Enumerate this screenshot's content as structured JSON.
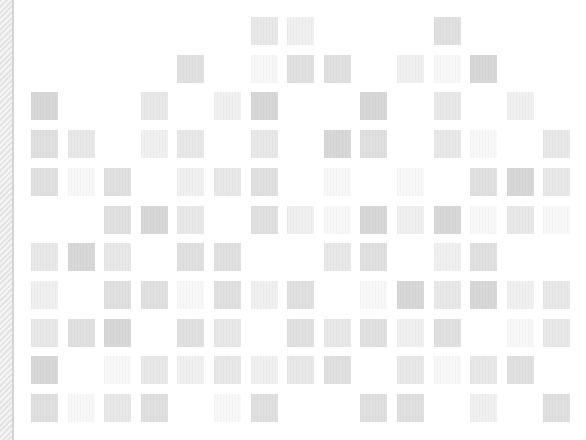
{
  "layout": {
    "cols": 15,
    "rows": 11,
    "x0": 31,
    "y0": 17,
    "dx": 36.6,
    "dy": 37.7
  },
  "shades": {
    "1": "#f8f8f8",
    "2": "#f0f0f0",
    "3": "#e8e8e8",
    "4": "#e0e0e0",
    "5": "#d8d8d8"
  },
  "grid": [
    [
      0,
      0,
      0,
      0,
      0,
      0,
      3,
      2,
      0,
      0,
      0,
      4,
      0,
      0,
      0
    ],
    [
      0,
      0,
      0,
      0,
      4,
      0,
      1,
      4,
      4,
      0,
      2,
      1,
      5,
      0,
      0
    ],
    [
      5,
      0,
      0,
      3,
      0,
      2,
      5,
      0,
      0,
      5,
      0,
      3,
      0,
      2,
      0
    ],
    [
      4,
      3,
      0,
      2,
      3,
      0,
      3,
      0,
      5,
      4,
      0,
      3,
      1,
      0,
      3
    ],
    [
      4,
      1,
      4,
      0,
      2,
      3,
      4,
      0,
      1,
      0,
      1,
      0,
      4,
      5,
      3
    ],
    [
      0,
      0,
      4,
      5,
      3,
      0,
      4,
      2,
      1,
      5,
      2,
      5,
      1,
      3,
      1
    ],
    [
      3,
      5,
      3,
      0,
      4,
      4,
      0,
      0,
      3,
      4,
      0,
      2,
      4,
      0,
      0
    ],
    [
      2,
      0,
      4,
      4,
      1,
      4,
      2,
      4,
      0,
      1,
      5,
      3,
      5,
      2,
      3
    ],
    [
      3,
      4,
      5,
      0,
      4,
      3,
      0,
      4,
      3,
      4,
      2,
      4,
      0,
      1,
      3
    ],
    [
      5,
      0,
      1,
      3,
      2,
      3,
      2,
      3,
      4,
      0,
      3,
      1,
      3,
      4,
      0
    ],
    [
      4,
      1,
      3,
      4,
      0,
      1,
      4,
      0,
      0,
      4,
      4,
      0,
      2,
      0,
      4
    ]
  ]
}
